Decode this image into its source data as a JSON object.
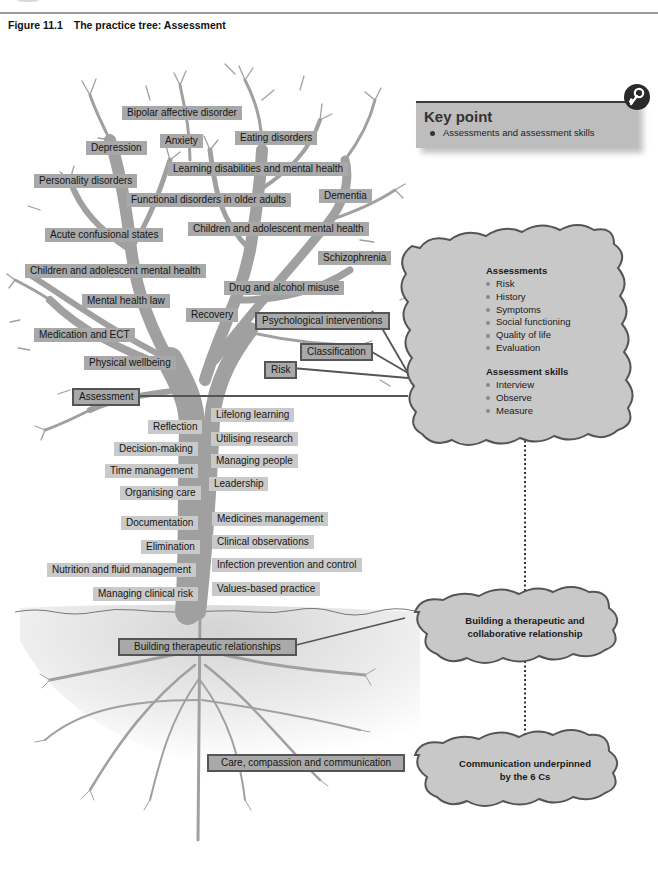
{
  "figure": {
    "number": "Figure 11.1",
    "title": "The practice tree: Assessment"
  },
  "key_point": {
    "title": "Key point",
    "items": [
      "Assessments and assessment skills"
    ],
    "icon": "key-icon"
  },
  "branches": [
    {
      "label": "Bipolar affective disorder",
      "boxed": false
    },
    {
      "label": "Anxiety",
      "boxed": false
    },
    {
      "label": "Eating disorders",
      "boxed": false
    },
    {
      "label": "Depression",
      "boxed": false
    },
    {
      "label": "Learning disabilities and mental health",
      "boxed": false
    },
    {
      "label": "Personality disorders",
      "boxed": false
    },
    {
      "label": "Functional disorders in older adults",
      "boxed": false
    },
    {
      "label": "Dementia",
      "boxed": false
    },
    {
      "label": "Acute confusional states",
      "boxed": false
    },
    {
      "label": "Children and adolescent mental health",
      "boxed": false
    },
    {
      "label": "Schizophrenia",
      "boxed": false
    },
    {
      "label": "Children and adolescent mental health",
      "boxed": false
    },
    {
      "label": "Drug and alcohol misuse",
      "boxed": false
    },
    {
      "label": "Mental health law",
      "boxed": false
    },
    {
      "label": "Recovery",
      "boxed": false
    },
    {
      "label": "Psychological interventions",
      "boxed": true
    },
    {
      "label": "Medication and ECT",
      "boxed": false
    },
    {
      "label": "Classification",
      "boxed": true
    },
    {
      "label": "Physical wellbeing",
      "boxed": false
    },
    {
      "label": "Risk",
      "boxed": true
    },
    {
      "label": "Assessment",
      "boxed": true
    }
  ],
  "trunk": {
    "left": [
      "Reflection",
      "Decision-making",
      "Time management",
      "Organising care",
      "Documentation",
      "Elimination",
      "Nutrition and fluid management",
      "Managing clinical risk"
    ],
    "right": [
      "Lifelong learning",
      "Utilising research",
      "Managing people",
      "Leadership",
      "Medicines management",
      "Clinical observations",
      "Infection prevention and control",
      "Values-based practice"
    ]
  },
  "roots": {
    "building": "Building therapeutic relationships",
    "care": "Care, compassion and communication"
  },
  "clouds": {
    "assessments": {
      "heading": "Assessments",
      "items": [
        "Risk",
        "History",
        "Symptoms",
        "Social functioning",
        "Quality of life",
        "Evaluation"
      ]
    },
    "skills": {
      "heading": "Assessment skills",
      "items": [
        "Interview",
        "Observe",
        "Measure"
      ]
    },
    "relationship": {
      "line1": "Building a therapeutic and",
      "line2": "collaborative relationship"
    },
    "communication": {
      "line1": "Communication underpinned",
      "line2": "by the 6 Cs"
    }
  },
  "colors": {
    "branch": "#a0a0a0",
    "label_dark": "#a8a8a8",
    "label_light": "#c9c9c9",
    "cloud_fill": "#c8c8c8",
    "cloud_stroke": "#555555",
    "keypoint_bg": "#bdbdbd"
  }
}
